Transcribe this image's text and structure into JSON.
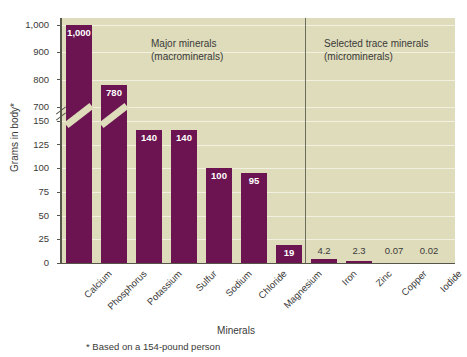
{
  "chart_data": {
    "type": "bar",
    "title": "",
    "xlabel": "Minerals",
    "ylabel": "Grams in body*",
    "footnote": "* Based on a 154-pound person",
    "categories": [
      "Calcium",
      "Phosphorus",
      "Potassium",
      "Sulfur",
      "Sodium",
      "Chloride",
      "Magnesium",
      "Iron",
      "Zinc",
      "Copper",
      "Iodide"
    ],
    "values": [
      1000,
      780,
      140,
      140,
      100,
      95,
      19,
      4.2,
      2.3,
      0.07,
      0.02
    ],
    "value_labels": [
      "1,000",
      "780",
      "140",
      "140",
      "100",
      "95",
      "19",
      "4.2",
      "2.3",
      "0.07",
      "0.02"
    ],
    "label_placement": [
      "inside",
      "inside",
      "inside",
      "inside",
      "inside",
      "inside",
      "inside",
      "outside",
      "outside",
      "outside",
      "outside"
    ],
    "ytick_labels": [
      "1,000",
      "900",
      "800",
      "700",
      "150",
      "125",
      "100",
      "75",
      "50",
      "25",
      "0"
    ],
    "ytick_values": [
      1000,
      900,
      800,
      700,
      150,
      125,
      100,
      75,
      50,
      25,
      0
    ],
    "axis_break": true,
    "axis_break_between": [
      150,
      700
    ],
    "grid": true,
    "legend_position": "none",
    "annotations": [
      {
        "name": "major-minerals",
        "line1": "Major minerals",
        "line2": "(macrominerals)"
      },
      {
        "name": "trace-minerals",
        "line1": "Selected trace minerals",
        "line2": "(microminerals)"
      }
    ],
    "colors": {
      "bar": "#6b1451",
      "plot_background": "#dedcbb",
      "gridline": "#f2f1df",
      "axis": "#55554a",
      "text": "#3a3a38",
      "divider": "#6d6d5e",
      "page_background": "#ffffff"
    }
  }
}
